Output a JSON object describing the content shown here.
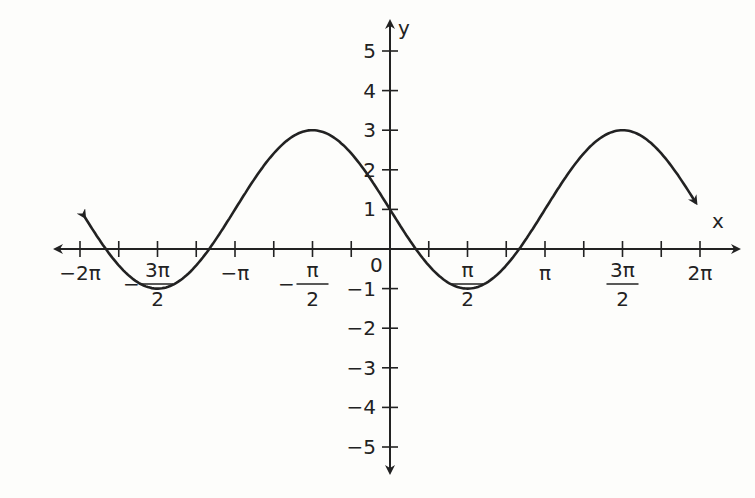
{
  "chart_data": {
    "type": "line",
    "title": "",
    "function": "y = 1 - 2 sin(x)",
    "xlabel": "x",
    "ylabel": "y",
    "xlim": [
      -6.2832,
      6.2832
    ],
    "ylim": [
      -5,
      5
    ],
    "grid": false,
    "x_tick_labels": [
      {
        "value": -6.2832,
        "label": "−2π"
      },
      {
        "value": -4.7124,
        "label": "−3π/2"
      },
      {
        "value": -3.1416,
        "label": "−π"
      },
      {
        "value": -1.5708,
        "label": "−π/2"
      },
      {
        "value": 1.5708,
        "label": "π/2"
      },
      {
        "value": 3.1416,
        "label": "π"
      },
      {
        "value": 4.7124,
        "label": "3π/2"
      },
      {
        "value": 6.2832,
        "label": "2π"
      }
    ],
    "x_ticks_minor_step": 0.7854,
    "y_tick_labels": [
      "5",
      "4",
      "3",
      "2",
      "1",
      "0",
      "−1",
      "−2",
      "−3",
      "−4",
      "−5"
    ],
    "series": [
      {
        "name": "curve",
        "x": [
          -6.17,
          -5.5,
          -4.7124,
          -3.67,
          -3.1416,
          -2.62,
          -1.5708,
          -0.52,
          0,
          0.52,
          1.5708,
          2.62,
          3.1416,
          3.67,
          4.7124,
          5.76,
          6.2
        ],
        "values": [
          0.75,
          -0.41,
          -1,
          -0.0,
          1,
          2.0,
          3,
          2.0,
          1,
          0.0,
          -1,
          0.0,
          1,
          2.0,
          3,
          2.0,
          1.17
        ]
      }
    ],
    "key_points": {
      "max": [
        [
          -1.5708,
          3
        ],
        [
          4.7124,
          3
        ]
      ],
      "min": [
        [
          -4.7124,
          -1
        ],
        [
          1.5708,
          -1
        ]
      ],
      "y_intercept": [
        0,
        1
      ]
    }
  },
  "axes": {
    "x_label": "x",
    "y_label": "y",
    "origin_label": "0"
  }
}
